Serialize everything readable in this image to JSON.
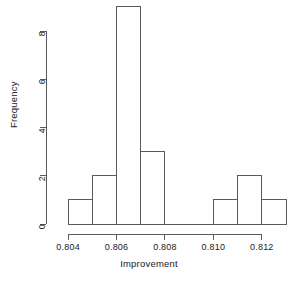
{
  "chart_data": {
    "type": "bar",
    "title": "",
    "subtitle": "",
    "xlabel": "Improvement",
    "ylabel": "Frequency",
    "grid": false,
    "legend": "none",
    "style": "r-base-hist",
    "bar_fill": "#ffffff",
    "bar_stroke": "#5a5a5a",
    "axis_color": "#5a5a5a",
    "text_color": "#1a1a1a",
    "bin_width": 0.001,
    "xlim": [
      0.8035,
      0.813
    ],
    "ylim": [
      0,
      9
    ],
    "xticks": [
      0.804,
      0.806,
      0.808,
      0.81,
      0.812
    ],
    "xticklabels": [
      "0.804",
      "0.806",
      "0.808",
      "0.810",
      "0.812"
    ],
    "yticks": [
      0,
      2,
      4,
      6,
      8
    ],
    "yticklabels": [
      "0",
      "2",
      "4",
      "6",
      "8"
    ],
    "bins": [
      {
        "left": 0.804,
        "right": 0.805,
        "value": 1
      },
      {
        "left": 0.805,
        "right": 0.806,
        "value": 2
      },
      {
        "left": 0.806,
        "right": 0.807,
        "value": 9
      },
      {
        "left": 0.807,
        "right": 0.808,
        "value": 3
      },
      {
        "left": 0.808,
        "right": 0.809,
        "value": 0
      },
      {
        "left": 0.809,
        "right": 0.81,
        "value": 0
      },
      {
        "left": 0.81,
        "right": 0.811,
        "value": 1
      },
      {
        "left": 0.811,
        "right": 0.812,
        "value": 2
      },
      {
        "left": 0.812,
        "right": 0.813,
        "value": 1
      }
    ],
    "categories": [
      "0.804-0.805",
      "0.805-0.806",
      "0.806-0.807",
      "0.807-0.808",
      "0.808-0.809",
      "0.809-0.810",
      "0.810-0.811",
      "0.811-0.812",
      "0.812-0.813"
    ],
    "values": [
      1,
      2,
      9,
      3,
      0,
      0,
      1,
      2,
      1
    ]
  }
}
